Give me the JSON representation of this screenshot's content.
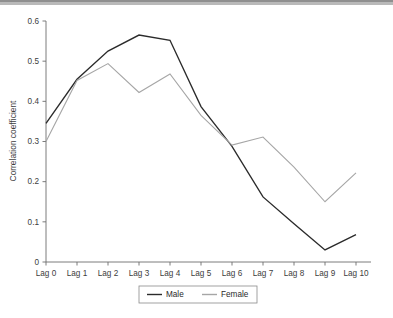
{
  "chart_data": {
    "type": "line",
    "title": "",
    "xlabel": "",
    "ylabel": "Correlation coefficient",
    "categories": [
      "Lag 0",
      "Lag 1",
      "Lag 2",
      "Lag 3",
      "Lag 4",
      "Lag 5",
      "Lag 6",
      "Lag 7",
      "Lag 8",
      "Lag 9",
      "Lag 10"
    ],
    "ylim": [
      0,
      0.6
    ],
    "ytick_labels": [
      "0.6",
      "0.5",
      "0.4",
      "0.3",
      "0.2",
      "0.1",
      "0"
    ],
    "ytick_values": [
      0.6,
      0.5,
      0.4,
      0.3,
      0.2,
      0.1,
      0
    ],
    "grid": false,
    "legend_position": "bottom",
    "series": [
      {
        "name": "Male",
        "color": "#2b2b2b",
        "values": [
          0.345,
          0.455,
          0.525,
          0.565,
          0.552,
          0.387,
          0.288,
          0.162,
          0.095,
          0.03,
          0.068
        ]
      },
      {
        "name": "Female",
        "color": "#a6a6a6",
        "values": [
          0.3,
          0.452,
          0.494,
          0.422,
          0.468,
          0.365,
          0.291,
          0.311,
          0.236,
          0.15,
          0.222
        ]
      }
    ]
  },
  "axes": {
    "y_title": "Correlation coefficient"
  },
  "legend": {
    "entries": [
      {
        "label": "Male"
      },
      {
        "label": "Female"
      }
    ]
  },
  "colors": {
    "male_line": "#2b2b2b",
    "female_line": "#a6a6a6",
    "axis": "#6d6d6d",
    "text": "#3d3d3d",
    "top_band": "#b9b9b9"
  }
}
